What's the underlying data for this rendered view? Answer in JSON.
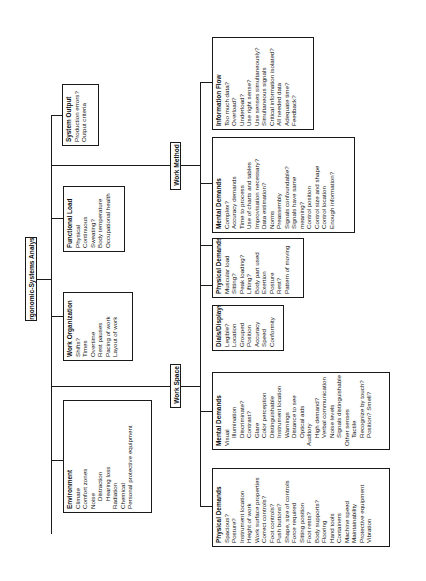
{
  "root": {
    "label": "Ergonomic-Systems Analysis"
  },
  "branches": {
    "work_space": {
      "label": "Work Space"
    },
    "work_method": {
      "label": "Work Method"
    }
  },
  "boxes": {
    "environment": {
      "title": "Environment",
      "items": [
        "Climate",
        "Comfort zones",
        "Noise",
        "Distraction",
        "Hearing loss",
        "Radiation",
        "Chemical",
        "Personal protective equipment"
      ]
    },
    "work_organization": {
      "title": "Work Organization",
      "items": [
        "Shifts?",
        "Times",
        "Overtime",
        "Rest pauses",
        "Pacing of work",
        "Layout of work"
      ]
    },
    "functional_load": {
      "title": "Functional Load",
      "items": [
        "Physical",
        "Continuous",
        "Sweating?",
        "Body temperature",
        "Occupational health"
      ]
    },
    "system_output": {
      "title": "System Output",
      "items": [
        "Production errors?",
        "Output criteria"
      ]
    },
    "ws_physical_demands": {
      "title": "Physical Demands",
      "items": [
        "Spacious?",
        "Posture?",
        "Instrument location",
        "Height of work",
        "Work surface properties",
        "Correct controls?",
        "Foot controls?",
        "Push buttons?",
        "Shape, size of controls",
        "Force required",
        "Sitting position",
        "Foot rests?",
        "Body supports?",
        "Flooring",
        "Hand tools",
        "Containers",
        "Machine speed",
        "Maintainability",
        "Protective equipment",
        "Vibration"
      ]
    },
    "ws_mental_demands": {
      "title": "Mental Demands",
      "items": [
        "Visual",
        "Illumination",
        "Discriminate?",
        "Contrast?",
        "Glare",
        "Color perception",
        "Distinguishable",
        "Instrument location",
        "Warnings",
        "Distance to see",
        "Optical aids",
        "Auditory",
        "High demand?",
        "Verbal communication",
        "Noise levels",
        "Signals distinguishable",
        "Other senses",
        "Tactile",
        "Recognize by touch?",
        "Position? Smell?"
      ]
    },
    "dials_displays": {
      "title": "Dials/Displays",
      "items": [
        "Legible?",
        "Location",
        "Grouped",
        "Position",
        "Accuracy",
        "Speed",
        "Conformity"
      ]
    },
    "wm_physical_demands": {
      "title": "Physical Demands",
      "items": [
        "Muscular load",
        "Sitting?",
        "Peak loading?",
        "Lifting?",
        "Body part used",
        "Exertion",
        "Posture",
        "Rest?",
        "Pattern of moving"
      ]
    },
    "wm_mental_demands": {
      "title": "Mental Demands",
      "items": [
        "Complex?",
        "Accuracy demands",
        "Time to process",
        "Use of charts and tables",
        "Improvisation necessary?",
        "Data estimation?",
        "Norms",
        "Preassembly",
        "Signals confoundable?",
        "Signals have same",
        "meaning?",
        "Control position",
        "Control size and shape",
        "Control location",
        "Enough information?"
      ]
    },
    "information_flow": {
      "title": "Information Flow",
      "items": [
        "Too much data?",
        "Overload?",
        "Underload?",
        "Use right sense?",
        "Use senses simultaneously?",
        "Simultaneous signals",
        "Critical information isolated?",
        "All needed data",
        "Adequate time?",
        "Feedback?"
      ]
    }
  }
}
